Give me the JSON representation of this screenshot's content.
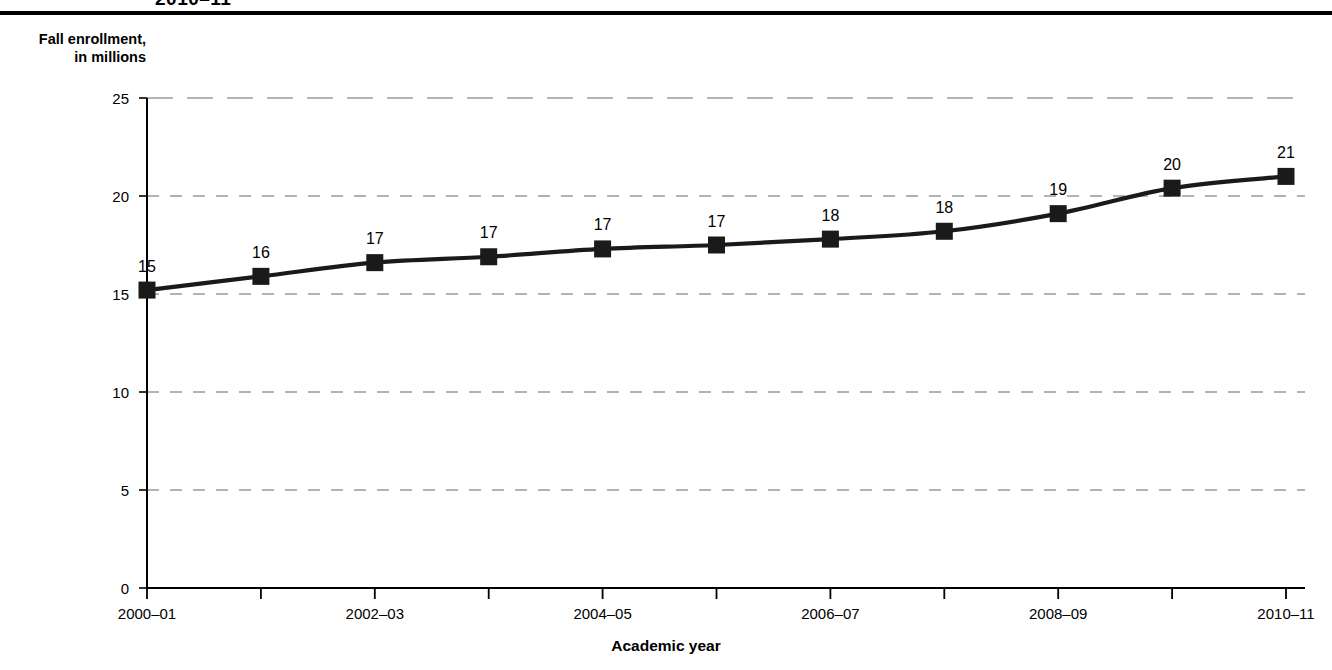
{
  "header": {
    "clipped_title": "2010–11",
    "rule_color": "#000000"
  },
  "axes": {
    "y_caption": "Fall enrollment,\nin millions",
    "x_title": "Academic year"
  },
  "chart_data": {
    "type": "line",
    "title": "2010–11",
    "xlabel": "Academic year",
    "ylabel": "Fall enrollment, in millions",
    "ylim": [
      0,
      25
    ],
    "y_ticks": [
      0,
      5,
      10,
      15,
      20,
      25
    ],
    "y_tick_labels": [
      "0",
      "5",
      "10",
      "15",
      "20",
      "25"
    ],
    "grid": true,
    "grid_style": "dashed-horizontal",
    "legend": "none",
    "marker": "square",
    "marker_color": "#1a1a1a",
    "line_color": "#1a1a1a",
    "categories": [
      "2000–01",
      "2001–02",
      "2002–03",
      "2003–04",
      "2004–05",
      "2005–06",
      "2006–07",
      "2007–08",
      "2008–09",
      "2009–10",
      "2010–11"
    ],
    "x_tick_labels": [
      "2000–01",
      "",
      "2002–03",
      "",
      "2004–05",
      "",
      "2006–07",
      "",
      "2008–09",
      "",
      "2010–11"
    ],
    "values": [
      15.2,
      15.9,
      16.6,
      16.9,
      17.3,
      17.5,
      17.8,
      18.2,
      19.1,
      20.4,
      21.0
    ],
    "data_labels": [
      "15",
      "16",
      "17",
      "17",
      "17",
      "17",
      "18",
      "18",
      "19",
      "20",
      "21"
    ]
  }
}
